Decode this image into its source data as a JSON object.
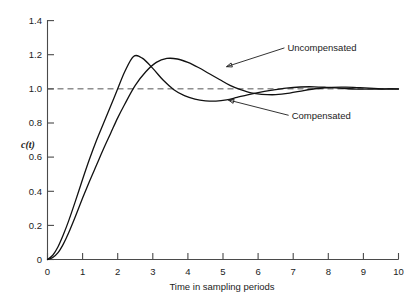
{
  "figure": {
    "background": "#ffffff",
    "ink": "#111111"
  },
  "chart_data": {
    "type": "line",
    "title": "",
    "xlabel": "Time in sampling periods",
    "ylabel": "c(t)",
    "xlim": [
      0,
      10
    ],
    "ylim": [
      0,
      1.4
    ],
    "xticks": [
      "0",
      "1",
      "2",
      "3",
      "4",
      "5",
      "6",
      "7",
      "8",
      "9",
      "10"
    ],
    "xtick_values": [
      0,
      1,
      2,
      3,
      4,
      5,
      6,
      7,
      8,
      9,
      10
    ],
    "yticks": [
      "0",
      "0.2",
      "0.4",
      "0.6",
      "0.8",
      "1.0",
      "1.2",
      "1.4"
    ],
    "ytick_values": [
      0,
      0.2,
      0.4,
      0.6,
      0.8,
      1.0,
      1.2,
      1.4
    ],
    "grid": false,
    "legend_position": "inline-annotations",
    "reference_lines": [
      {
        "name": "steady-state",
        "axis": "y",
        "value": 1.0,
        "style": "dashed"
      }
    ],
    "annotations": [
      {
        "text": "Uncompensated",
        "text_x": 6.75,
        "text_y": 1.24,
        "target_x": 5.1,
        "target_y": 1.13
      },
      {
        "text": "Compensated",
        "text_x": 6.87,
        "text_y": 0.845,
        "target_x": 5.15,
        "target_y": 0.935
      }
    ],
    "series": [
      {
        "name": "Compensated",
        "peak_value": 1.19,
        "peak_time": 2.45,
        "undershoot_value": 0.93,
        "undershoot_time": 4.8,
        "x": [
          0,
          0.15,
          0.3,
          0.45,
          0.6,
          0.8,
          1.0,
          1.2,
          1.4,
          1.6,
          1.8,
          2.0,
          2.2,
          2.45,
          2.7,
          3.0,
          3.3,
          3.6,
          3.9,
          4.2,
          4.5,
          4.8,
          5.1,
          5.4,
          5.7,
          6.0,
          6.4,
          6.8,
          7.2,
          7.6,
          8.0,
          8.4,
          8.8,
          9.2,
          9.6,
          10.0
        ],
        "y": [
          0.0,
          0.025,
          0.075,
          0.145,
          0.225,
          0.345,
          0.47,
          0.59,
          0.7,
          0.8,
          0.9,
          1.0,
          1.1,
          1.19,
          1.18,
          1.12,
          1.05,
          0.995,
          0.96,
          0.94,
          0.93,
          0.928,
          0.935,
          0.95,
          0.965,
          0.978,
          0.992,
          1.004,
          1.011,
          1.012,
          1.008,
          1.003,
          0.999,
          0.998,
          0.999,
          1.0
        ]
      },
      {
        "name": "Uncompensated",
        "peak_value": 1.18,
        "peak_time": 3.4,
        "undershoot_value": 0.965,
        "undershoot_time": 5.6,
        "x": [
          0,
          0.15,
          0.3,
          0.45,
          0.6,
          0.8,
          1.0,
          1.2,
          1.4,
          1.6,
          1.8,
          2.0,
          2.2,
          2.5,
          2.8,
          3.1,
          3.4,
          3.7,
          4.0,
          4.3,
          4.6,
          4.9,
          5.2,
          5.5,
          5.8,
          6.1,
          6.5,
          6.9,
          7.3,
          7.7,
          8.1,
          8.5,
          8.9,
          9.3,
          9.6,
          10.0
        ],
        "y": [
          0.0,
          0.012,
          0.04,
          0.09,
          0.155,
          0.255,
          0.36,
          0.46,
          0.555,
          0.65,
          0.74,
          0.83,
          0.91,
          1.02,
          1.1,
          1.155,
          1.178,
          1.175,
          1.155,
          1.125,
          1.09,
          1.055,
          1.02,
          0.995,
          0.976,
          0.968,
          0.966,
          0.975,
          0.99,
          1.002,
          1.009,
          1.01,
          1.007,
          1.003,
          1.0,
          0.999
        ]
      }
    ]
  }
}
